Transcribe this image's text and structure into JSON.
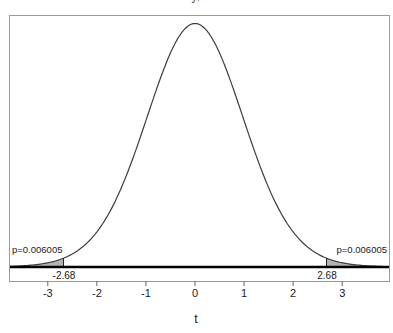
{
  "title": {
    "text": "t density, df = 29"
  },
  "labels": {
    "p_left": "p=0.006005",
    "p_right": "p=0.006005",
    "crit_left": "-2.68",
    "crit_right": "2.68",
    "xlab": "t"
  },
  "chart_data": {
    "type": "line",
    "subtype": "density-curve-with-shaded-tails",
    "title": "t density, df = 29",
    "xlabel": "t",
    "ylabel": "",
    "distribution": "t",
    "df": 29,
    "peak_density": 0.3964,
    "xlim": [
      -3.79,
      3.95
    ],
    "ylim": [
      0,
      0.41
    ],
    "x_ticks": [
      -3,
      -2,
      -1,
      0,
      1,
      2,
      3
    ],
    "critical_values": [
      -2.68,
      2.68
    ],
    "tail_probability_each": 0.006005,
    "annotations": [
      {
        "text": "p=0.006005",
        "side": "left-tail"
      },
      {
        "text": "p=0.006005",
        "side": "right-tail"
      },
      {
        "text": "-2.68",
        "x": -2.68
      },
      {
        "text": "2.68",
        "x": 2.68
      }
    ],
    "grid": false,
    "legend": false,
    "colors": {
      "curve": "#3d3d3d",
      "tail_fill": "#b3b3b3",
      "baseline": "#000000",
      "box": "#9a9a9a",
      "tick": "#666666",
      "text": "#1a1a1a"
    }
  }
}
